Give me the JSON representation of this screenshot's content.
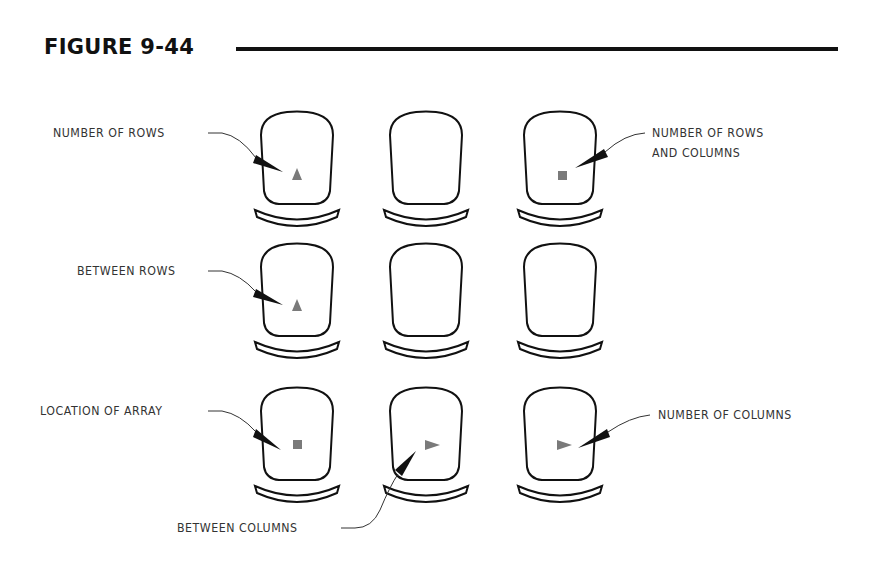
{
  "figure": {
    "title": "FIGURE 9-44"
  },
  "labels": {
    "number_of_rows": "NUMBER OF ROWS",
    "number_of_rows_and_columns_line1": "NUMBER OF ROWS",
    "number_of_rows_and_columns_line2": "AND COLUMNS",
    "between_rows": "BETWEEN ROWS",
    "location_of_array": "LOCATION OF ARRAY",
    "number_of_columns": "NUMBER OF COLUMNS",
    "between_columns": "BETWEEN COLUMNS"
  },
  "grid": {
    "rows": 3,
    "columns": 3,
    "icons": [
      [
        "triangle-up",
        "none",
        "square"
      ],
      [
        "triangle-up",
        "none",
        "none"
      ],
      [
        "square",
        "triangle-right",
        "triangle-right"
      ]
    ]
  },
  "colors": {
    "ink": "#111111",
    "marker": "#7a7a7a"
  }
}
